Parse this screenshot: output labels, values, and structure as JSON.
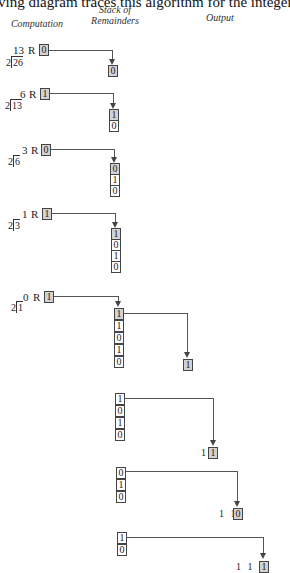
{
  "intro_text": "ving diagram traces this algorithm for the integer 26",
  "headers": {
    "computation": "Computation",
    "stack": "Stack of\nRemainders",
    "stack_line1": "Stack of",
    "stack_line2": "Remainders",
    "output": "Output"
  },
  "steps": [
    {
      "quotient": "13",
      "r_label": "R",
      "remainder": "0",
      "divisor": "2",
      "dividend": "26"
    },
    {
      "quotient": "6",
      "r_label": "R",
      "remainder": "1",
      "divisor": "2",
      "dividend": "13"
    },
    {
      "quotient": "3",
      "r_label": "R",
      "remainder": "0",
      "divisor": "2",
      "dividend": "6"
    },
    {
      "quotient": "1",
      "r_label": "R",
      "remainder": "1",
      "divisor": "2",
      "dividend": "3"
    },
    {
      "quotient": "0",
      "r_label": "R",
      "remainder": "1",
      "divisor": "2",
      "dividend": "1"
    }
  ],
  "push_stacks": [
    [
      "0"
    ],
    [
      "1",
      "0"
    ],
    [
      "0",
      "1",
      "0"
    ],
    [
      "1",
      "0",
      "1",
      "0"
    ],
    [
      "1",
      "1",
      "0",
      "1",
      "0"
    ]
  ],
  "pop_stacks": [
    [
      "1",
      "0",
      "1",
      "0"
    ],
    [
      "0",
      "1",
      "0"
    ],
    [
      "1",
      "0"
    ]
  ],
  "outputs": [
    {
      "prefix": "",
      "popped": "1"
    },
    {
      "prefix": "1",
      "popped": "1"
    },
    {
      "prefix": "1 1",
      "popped": "0"
    },
    {
      "prefix": "1 1 0",
      "popped": "1"
    }
  ]
}
